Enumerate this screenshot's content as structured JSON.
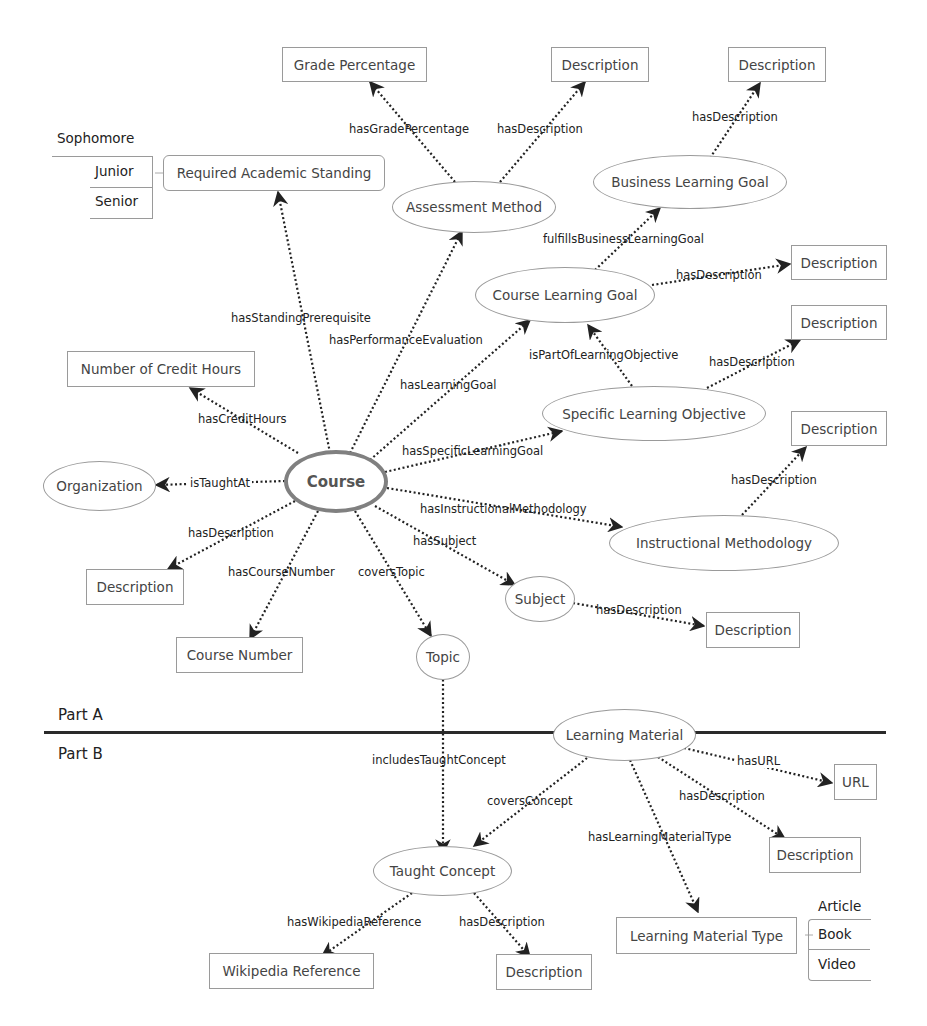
{
  "diagram": {
    "type": "ontology-graph",
    "sections": {
      "part_a": "Part A",
      "part_b": "Part B"
    },
    "nodes": {
      "course": "Course",
      "grade_percentage": "Grade Percentage",
      "desc_assessment": "Description",
      "desc_business_goal": "Description",
      "required_standing": "Required Academic Standing",
      "assessment_method": "Assessment Method",
      "business_learning_goal": "Business Learning Goal",
      "desc_course_goal": "Description",
      "course_learning_goal": "Course Learning Goal",
      "desc_specific_objective": "Description",
      "credit_hours": "Number of Credit Hours",
      "specific_learning_objective": "Specific Learning Objective",
      "desc_instructional": "Description",
      "organization": "Organization",
      "instructional_methodology": "Instructional Methodology",
      "desc_course": "Description",
      "subject": "Subject",
      "desc_subject": "Description",
      "course_number": "Course Number",
      "topic": "Topic",
      "learning_material": "Learning Material",
      "url": "URL",
      "desc_learning_material": "Description",
      "taught_concept": "Taught Concept",
      "learning_material_type": "Learning Material Type",
      "wikipedia_reference": "Wikipedia Reference",
      "desc_taught_concept": "Description"
    },
    "standing_values": [
      "Sophomore",
      "Junior",
      "Senior"
    ],
    "material_type_values": [
      "Article",
      "Book",
      "Video"
    ],
    "edges": {
      "has_grade_percentage": "hasGradePercentage",
      "assessment_has_description": "hasDescription",
      "business_goal_has_description": "hasDescription",
      "fulfills_business_learning_goal": "fulfillsBusinessLearningGoal",
      "course_goal_has_description": "hasDescription",
      "has_standing_prerequisite": "hasStandingPrerequisite",
      "has_performance_evaluation": "hasPerformanceEvaluation",
      "is_part_of_learning_objective": "isPartOfLearningObjective",
      "objective_has_description": "hasDescription",
      "has_learning_goal": "hasLearningGoal",
      "has_credit_hours": "hasCreditHours",
      "has_specific_learning_goal": "hasSpecificLearningGoal",
      "methodology_has_description": "hasDescription",
      "is_taught_at": "isTaughtAt",
      "has_instructional_methodology": "hasInstructionalMethodology",
      "course_has_description": "hasDescription",
      "has_subject": "hasSubject",
      "has_course_number": "hasCourseNumber",
      "covers_topic": "coversTopic",
      "subject_has_description": "hasDescription",
      "includes_taught_concept": "includesTaughtConcept",
      "has_url": "hasURL",
      "material_has_description": "hasDescription",
      "covers_concept": "coversConcept",
      "has_learning_material_type": "hasLearningMaterialType",
      "has_wikipedia_reference": "hasWikipediaReference",
      "concept_has_description": "hasDescription"
    },
    "colors": {
      "node_border": "#9a9a9a",
      "center_border": "#808080",
      "edge": "#222222",
      "divider": "#2a2a2a"
    }
  }
}
